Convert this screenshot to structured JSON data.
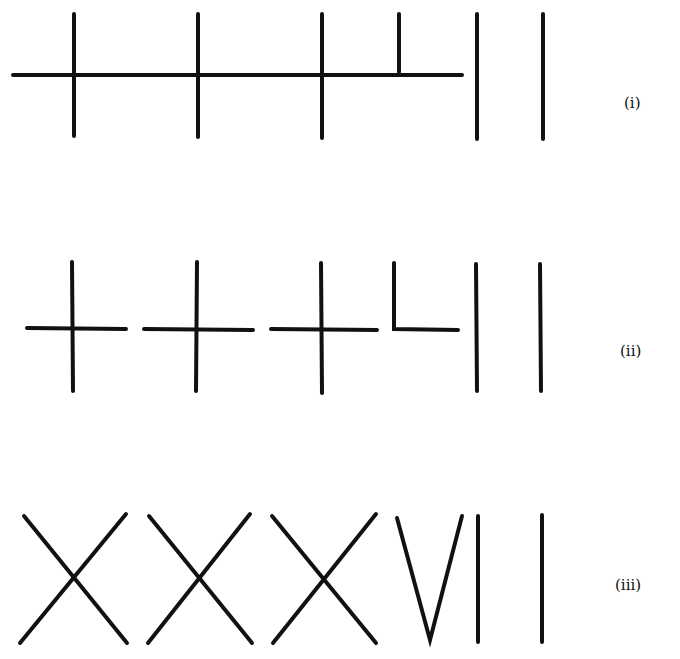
{
  "figure": {
    "stroke_color": "#111111",
    "rows": [
      {
        "label": "(i)",
        "description": "Tally: three full crosses and a half-cross on one continuous horizontal bar, then two vertical strokes",
        "label_pos": [
          624,
          108
        ]
      },
      {
        "label": "(ii)",
        "description": "Separated: three crosses, an L-shaped stroke, then two vertical strokes",
        "label_pos": [
          620,
          356
        ]
      },
      {
        "label": "(iii)",
        "description": "Roman numerals: X X X V I I",
        "label_pos": [
          615,
          590
        ]
      }
    ]
  }
}
